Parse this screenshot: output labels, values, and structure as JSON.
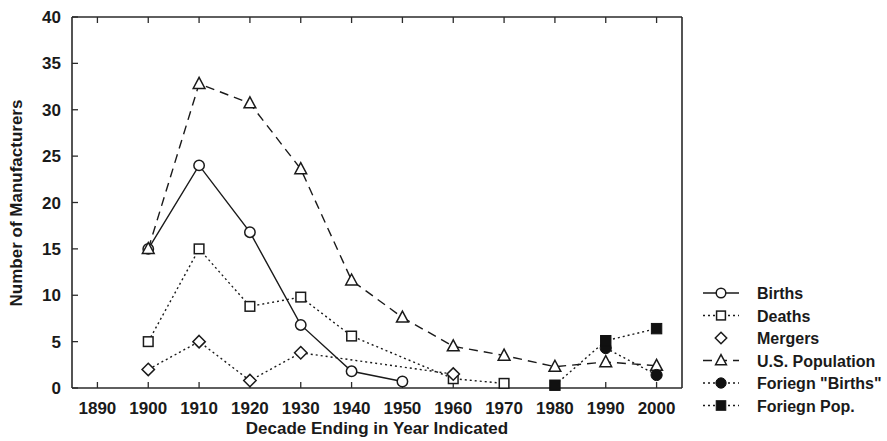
{
  "chart_data": {
    "type": "line",
    "title": "",
    "xlabel": "Decade Ending in Year Indicated",
    "ylabel": "Number of Manufacturers",
    "x": [
      1890,
      1900,
      1910,
      1920,
      1930,
      1940,
      1950,
      1960,
      1970,
      1980,
      1990,
      2000
    ],
    "xticks": [
      "1890",
      "1900",
      "1910",
      "1920",
      "1930",
      "1940",
      "1950",
      "1960",
      "1970",
      "1980",
      "1990",
      "2000"
    ],
    "yticks": [
      "0",
      "5",
      "10",
      "15",
      "20",
      "25",
      "30",
      "35",
      "40"
    ],
    "xlim": [
      1885,
      2005
    ],
    "ylim": [
      0,
      40
    ],
    "grid": false,
    "legend_position": "right",
    "series": [
      {
        "name": "Births",
        "marker": "open-circle",
        "linestyle": "solid",
        "x": [
          1900,
          1910,
          1920,
          1930,
          1940,
          1950
        ],
        "values": [
          15,
          24,
          16.8,
          6.8,
          1.8,
          0.7
        ]
      },
      {
        "name": "Deaths",
        "marker": "open-square",
        "linestyle": "dotted",
        "x": [
          1900,
          1910,
          1920,
          1930,
          1940,
          1960,
          1970
        ],
        "values": [
          5,
          15,
          8.8,
          9.8,
          5.6,
          1.0,
          0.5
        ]
      },
      {
        "name": "Mergers",
        "marker": "open-diamond",
        "linestyle": "dotted",
        "x": [
          1900,
          1910,
          1920,
          1930,
          1960
        ],
        "values": [
          2,
          5,
          0.8,
          3.8,
          1.5
        ]
      },
      {
        "name": "U.S. Population",
        "marker": "open-triangle",
        "linestyle": "dashed",
        "x": [
          1900,
          1910,
          1920,
          1930,
          1940,
          1950,
          1960,
          1970,
          1980,
          1990,
          2000
        ],
        "values": [
          15,
          32.8,
          30.7,
          23.6,
          11.6,
          7.6,
          4.5,
          3.5,
          2.3,
          2.8,
          2.4
        ]
      },
      {
        "name": "Foriegn \"Births\"",
        "marker": "filled-circle",
        "linestyle": "dotted",
        "x": [
          1990,
          2000
        ],
        "values": [
          4.3,
          1.4
        ]
      },
      {
        "name": "Foriegn Pop.",
        "marker": "filled-square",
        "linestyle": "dotted",
        "x": [
          1980,
          1990,
          2000
        ],
        "values": [
          0.3,
          5.1,
          6.4
        ]
      }
    ]
  },
  "legend": {
    "items": [
      {
        "label": "Births"
      },
      {
        "label": "Deaths"
      },
      {
        "label": "Mergers"
      },
      {
        "label": "U.S. Population"
      },
      {
        "label": "Foriegn \"Births\""
      },
      {
        "label": "Foriegn Pop."
      }
    ]
  },
  "axes": {
    "y_title": "Number of Manufacturers",
    "x_title": "Decade Ending in Year Indicated"
  }
}
